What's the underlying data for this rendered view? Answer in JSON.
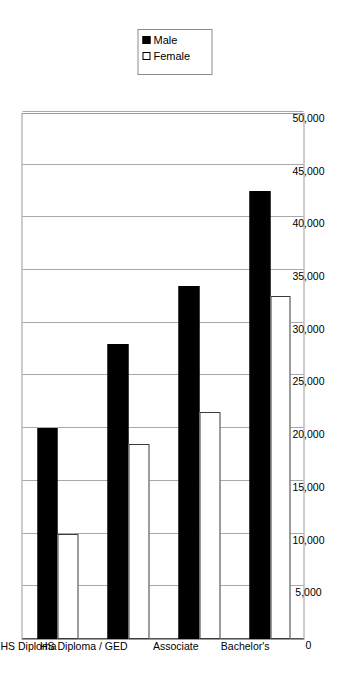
{
  "chart_data": {
    "type": "bar",
    "orientation": "horizontal",
    "title": "",
    "subtitle": "",
    "xlabel": "",
    "ylabel": "",
    "categories": [
      "No HS Diploma",
      "HS Diploma / GED",
      "Associate",
      "Bachelor's"
    ],
    "series": [
      {
        "name": "Male",
        "values": [
          20000,
          28000,
          33500,
          42500
        ],
        "color": "#000000",
        "fill": "solid"
      },
      {
        "name": "Female",
        "values": [
          10000,
          18500,
          21500,
          32500
        ],
        "color": "#ffffff",
        "fill": "hollow"
      }
    ],
    "value_axis": {
      "min": 0,
      "max": 50000,
      "step": 5000,
      "ticks": [
        0,
        5000,
        10000,
        15000,
        20000,
        25000,
        30000,
        35000,
        40000,
        45000,
        50000
      ],
      "tick_labels": [
        "0",
        "5,000",
        "10,000",
        "15,000",
        "20,000",
        "25,000",
        "30,000",
        "35,000",
        "40,000",
        "45,000",
        "50,000"
      ]
    },
    "grid": true,
    "grid_axis": "value",
    "legend": {
      "visible": true,
      "position": "top-right",
      "entries": [
        {
          "label": "Male",
          "marker": "filled-square"
        },
        {
          "label": "Female",
          "marker": "hollow-square"
        }
      ]
    },
    "annotations": [],
    "colors": {
      "background": "#ffffff",
      "grid": "#a8a8a8",
      "frame": "#9a9a9a",
      "text": "#000000",
      "male": "#000000",
      "female": "#ffffff"
    }
  }
}
